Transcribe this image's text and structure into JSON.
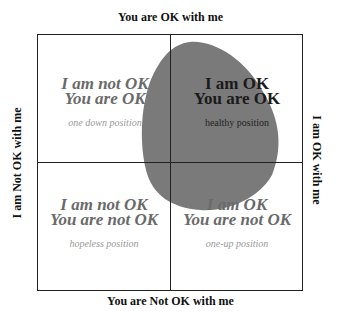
{
  "axes": {
    "top": "You are OK with me",
    "bottom": "You are Not OK with me",
    "left": "I am Not OK with me",
    "right": "I am OK with me"
  },
  "quadrants": [
    {
      "position": "top-left",
      "line1": "I am not OK",
      "line2": "You are OK",
      "label": "one down position"
    },
    {
      "position": "top-right",
      "line1": "I am OK",
      "line2": "You are OK",
      "label": "healthy position"
    },
    {
      "position": "bottom-left",
      "line1": "I am not OK",
      "line2": "You are not OK",
      "label": "hopeless position"
    },
    {
      "position": "bottom-right",
      "line1": "I am OK",
      "line2": "You are not OK",
      "label": "one-up position"
    }
  ],
  "colors": {
    "blob": "#7a7a7a",
    "lines": "#222222"
  }
}
